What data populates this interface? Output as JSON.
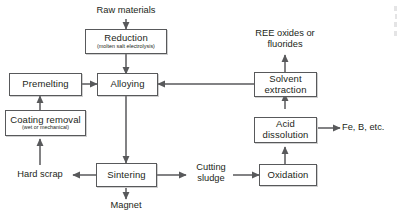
{
  "diagram": {
    "type": "process-flowchart",
    "colors": {
      "box_border": "#58595b",
      "box_fill": "#ffffff",
      "line": "#58595b",
      "text": "#231f20",
      "background": "#ffffff"
    },
    "nodes": [
      {
        "id": "reduction",
        "title": "Reduction",
        "subtitle": "(molten salt electrolysis)"
      },
      {
        "id": "premelting",
        "title": "Premelting",
        "subtitle": ""
      },
      {
        "id": "alloying",
        "title": "Alloying",
        "subtitle": ""
      },
      {
        "id": "coating_removal",
        "title": "Coating removal",
        "subtitle": "(wet or mechanical)"
      },
      {
        "id": "sintering",
        "title": "Sintering",
        "subtitle": ""
      },
      {
        "id": "solvent_extraction",
        "title": "Solvent extraction",
        "subtitle": ""
      },
      {
        "id": "acid_dissolution",
        "title": "Acid dissolution",
        "subtitle": ""
      },
      {
        "id": "oxidation",
        "title": "Oxidation",
        "subtitle": ""
      }
    ],
    "labels": [
      {
        "id": "raw_materials",
        "text": "Raw materials"
      },
      {
        "id": "ree_oxides",
        "text": "REE oxides or fluorides"
      },
      {
        "id": "fe_b_etc",
        "text": "Fe, B, etc."
      },
      {
        "id": "hard_scrap",
        "text": "Hard scrap"
      },
      {
        "id": "cutting_sludge",
        "text": "Cutting sludge"
      },
      {
        "id": "magnet",
        "text": "Magnet"
      }
    ],
    "edges": [
      {
        "from": "raw_materials",
        "to": "reduction"
      },
      {
        "from": "reduction",
        "to": "alloying"
      },
      {
        "from": "premelting",
        "to": "alloying"
      },
      {
        "from": "coating_removal",
        "to": "premelting"
      },
      {
        "from": "hard_scrap",
        "to": "coating_removal"
      },
      {
        "from": "alloying",
        "to": "sintering"
      },
      {
        "from": "sintering",
        "to": "magnet"
      },
      {
        "from": "sintering",
        "to": "hard_scrap"
      },
      {
        "from": "sintering",
        "to": "cutting_sludge"
      },
      {
        "from": "cutting_sludge",
        "to": "oxidation"
      },
      {
        "from": "oxidation",
        "to": "acid_dissolution"
      },
      {
        "from": "acid_dissolution",
        "to": "fe_b_etc"
      },
      {
        "from": "acid_dissolution",
        "to": "solvent_extraction"
      },
      {
        "from": "solvent_extraction",
        "to": "ree_oxides"
      },
      {
        "from": "solvent_extraction",
        "to": "alloying"
      }
    ]
  }
}
